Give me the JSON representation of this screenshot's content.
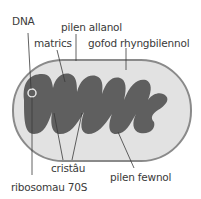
{
  "diagram": {
    "colors": {
      "outer_membrane": "#8a8a8a",
      "intermembrane_space": "#e2e2e2",
      "matrix": "#5f5f5f",
      "leader_lines": "#3a3a3a",
      "text": "#3a3a3a"
    },
    "labels": {
      "dna": "DNA",
      "outer_membrane": "pilen allanol",
      "matrix": "matrics",
      "intermembrane_space": "gofod rhyngbilennol",
      "cristae": "cristâu",
      "inner_membrane": "pilen fewnol",
      "ribosomes": "ribosomau 70S"
    }
  }
}
